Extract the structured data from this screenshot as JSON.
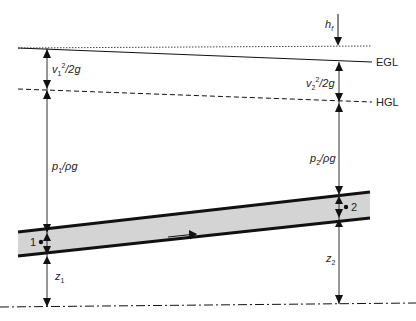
{
  "diagram": {
    "lines": {
      "egl_label": "EGL",
      "hgl_label": "HGL",
      "total_energy_line_style": "dotted",
      "egl_style": "solid",
      "hgl_style": "dashed",
      "datum_style": "dash-dot"
    },
    "labels": {
      "head_loss": {
        "base": "h",
        "sub": "f"
      },
      "velocity_head_1": {
        "base": "v",
        "sub": "1",
        "sup": "2",
        "rest": "/2g"
      },
      "velocity_head_2": {
        "base": "v",
        "sub": "2",
        "sup": "2",
        "rest": "/2g"
      },
      "pressure_head_1": {
        "base": "p",
        "sub": "1",
        "rest": "/ρg"
      },
      "pressure_head_2": {
        "base": "p",
        "sub": "2",
        "rest": "/ρg"
      },
      "elevation_1": {
        "base": "z",
        "sub": "1"
      },
      "elevation_2": {
        "base": "z",
        "sub": "2"
      },
      "point_1": "1",
      "point_2": "2"
    },
    "colors": {
      "line": "#111111",
      "pipe_fill": "#d4d4d4",
      "text": "#222222"
    }
  }
}
